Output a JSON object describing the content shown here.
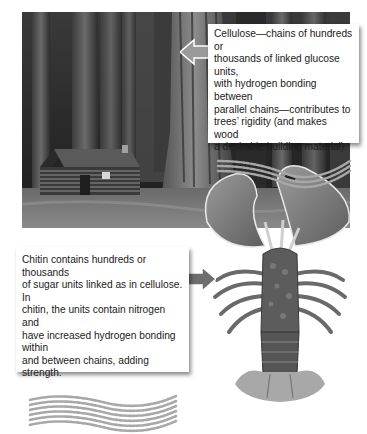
{
  "figure": {
    "photo": {
      "subject": "log cabin among giant redwood trees",
      "style": "black-and-white"
    },
    "cellulose_callout": {
      "text": "Cellulose—chains of hundreds or thousands of linked glucose units, with hydrogen bonding between parallel chains—contributes to trees’ rigidity (and makes wood a desirable building material).",
      "lines": [
        "Cellulose—chains of hundreds or",
        "thousands of linked glucose units,",
        "with hydrogen bonding between",
        "parallel chains—contributes to",
        "trees’ rigidity (and makes wood",
        "a desirable building material)."
      ],
      "diagram": "three parallel wavy chains of dots",
      "arrow_direction": "left",
      "arrow_color": "#9a9a9a"
    },
    "chitin_callout": {
      "text": "Chitin contains hundreds or thousands of sugar units linked as in cellulose. In chitin, the units contain nitrogen and have increased hydrogen bonding within and between chains, adding strength.",
      "lines": [
        "Chitin contains hundreds or thousands",
        "of sugar units linked as in cellulose. In",
        "chitin, the units contain nitrogen and",
        "have increased hydrogen bonding within",
        "and between chains, adding strength."
      ],
      "diagram": "dense band of wavy dotted chains",
      "arrow_direction": "right",
      "arrow_color": "#6e6e6e"
    },
    "lobster": {
      "subject": "lobster illustration",
      "dot_color": "#a8a8a8"
    }
  }
}
